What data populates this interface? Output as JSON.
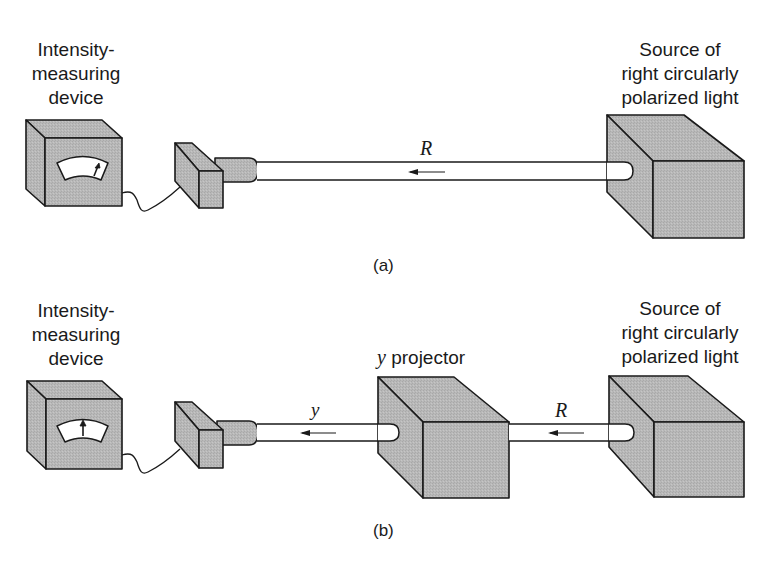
{
  "figure": {
    "panels": [
      {
        "id": "a",
        "caption": "(a)",
        "detector_label": [
          "Intensity-",
          "measuring",
          "device"
        ],
        "source_label": [
          "Source of",
          "right circularly",
          "polarized light"
        ],
        "beam_label": "R"
      },
      {
        "id": "b",
        "caption": "(b)",
        "detector_label": [
          "Intensity-",
          "measuring",
          "device"
        ],
        "projector_label_var": "y",
        "projector_label_text": " projector",
        "source_label": [
          "Source of",
          "right circularly",
          "polarized light"
        ],
        "beam_label_left": "y",
        "beam_label_right": "R"
      }
    ]
  },
  "colors": {
    "box_fill": "#b5b5b5",
    "box_top": "#c2c2c2",
    "box_side": "#a9a9a9",
    "stroke": "#1a1a1a",
    "beam_fill": "#ffffff",
    "background": "#ffffff"
  }
}
